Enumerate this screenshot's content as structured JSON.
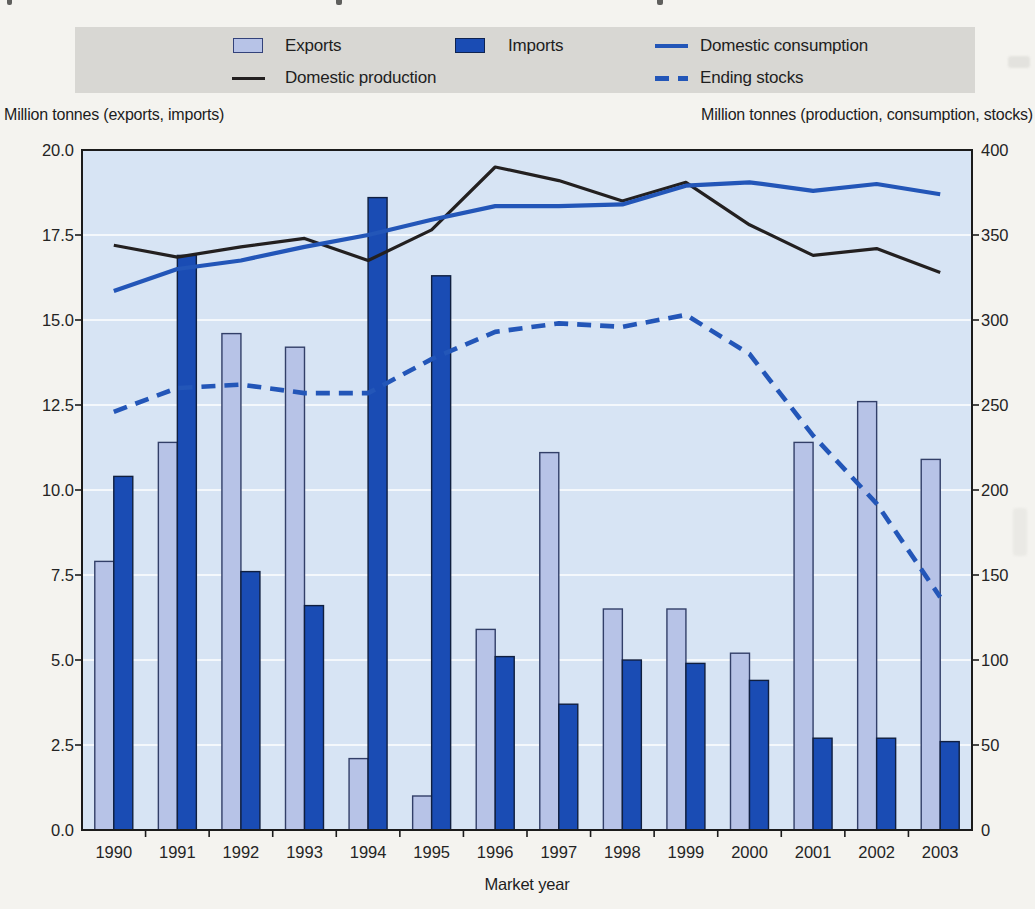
{
  "ui": {
    "legend": {
      "items": [
        {
          "id": "exports",
          "label": "Exports",
          "swatch": "bar-light"
        },
        {
          "id": "imports",
          "label": "Imports",
          "swatch": "bar-dark"
        },
        {
          "id": "consumption",
          "label": "Domestic consumption",
          "swatch": "line-blue"
        },
        {
          "id": "production",
          "label": "Domestic production",
          "swatch": "line-black"
        },
        {
          "id": "stocks",
          "label": "Ending stocks",
          "swatch": "dash-blue"
        }
      ]
    },
    "axis_headers": {
      "left": "Million tonnes (exports, imports)",
      "right": "Million tonnes (production, consumption, stocks)"
    }
  },
  "colors": {
    "exports_fill": "#b7c3e7",
    "imports_fill": "#1a4cb4",
    "blue_line": "#2356b8",
    "black_line": "#232020",
    "plot_bg": "#d7e4f4",
    "gridline": "#f4f8fc",
    "legend_bg": "#d8d7d3",
    "paper": "#f4f3ef"
  },
  "chart_data": {
    "type": "bar+line",
    "title": "",
    "xlabel": "Market year",
    "grid": true,
    "legend_position": "top",
    "categories": [
      "1990",
      "1991",
      "1992",
      "1993",
      "1994",
      "1995",
      "1996",
      "1997",
      "1998",
      "1999",
      "2000",
      "2001",
      "2002",
      "2003"
    ],
    "left_axis": {
      "title": "Million tonnes (exports, imports)",
      "min": 0,
      "max": 20,
      "step": 2.5,
      "tick_labels": [
        "0.0",
        "2.5",
        "5.0",
        "7.5",
        "10.0",
        "12.5",
        "15.0",
        "17.5",
        "20.0"
      ]
    },
    "right_axis": {
      "title": "Million tonnes (production, consumption, stocks)",
      "min": 0,
      "max": 400,
      "step": 50,
      "tick_labels": [
        "0",
        "50",
        "100",
        "150",
        "200",
        "250",
        "300",
        "350",
        "400"
      ]
    },
    "series": [
      {
        "name": "Exports",
        "type": "bar",
        "axis": "left",
        "color": "#b7c3e7",
        "values": [
          7.9,
          11.4,
          14.6,
          14.2,
          2.1,
          1.0,
          5.9,
          11.1,
          6.5,
          6.5,
          5.2,
          11.4,
          12.6,
          10.9
        ]
      },
      {
        "name": "Imports",
        "type": "bar",
        "axis": "left",
        "color": "#1a4cb4",
        "values": [
          10.4,
          16.9,
          7.6,
          6.6,
          18.6,
          16.3,
          5.1,
          3.7,
          5.0,
          4.9,
          4.4,
          2.7,
          2.7,
          2.6
        ]
      },
      {
        "name": "Domestic production",
        "type": "line",
        "axis": "right",
        "color": "#232020",
        "dashed": false,
        "values": [
          344,
          337,
          343,
          348,
          335,
          353,
          390,
          382,
          370,
          381,
          356,
          338,
          342,
          328
        ]
      },
      {
        "name": "Domestic consumption",
        "type": "line",
        "axis": "right",
        "color": "#2356b8",
        "dashed": false,
        "values": [
          317,
          330,
          335,
          343,
          350,
          359,
          367,
          367,
          368,
          379,
          381,
          376,
          380,
          374
        ]
      },
      {
        "name": "Ending stocks",
        "type": "line",
        "axis": "right",
        "color": "#2356b8",
        "dashed": true,
        "values": [
          246,
          260,
          262,
          257,
          257,
          277,
          293,
          298,
          296,
          303,
          280,
          232,
          192,
          137
        ]
      }
    ]
  }
}
